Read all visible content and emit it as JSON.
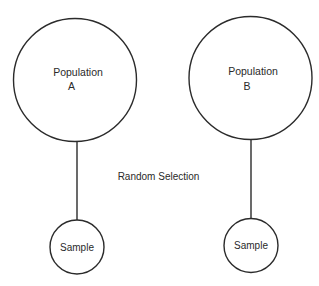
{
  "diagram": {
    "populations": [
      {
        "name": "Population",
        "id": "A"
      },
      {
        "name": "Population",
        "id": "B"
      }
    ],
    "samples": [
      {
        "label": "Sample"
      },
      {
        "label": "Sample"
      }
    ],
    "connector_label": "Random Selection"
  }
}
